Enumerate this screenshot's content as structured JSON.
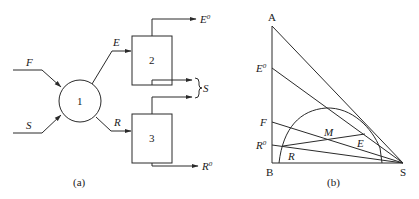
{
  "figure_a": {
    "caption": "(a)",
    "nodes": {
      "mixer": {
        "label": "1",
        "shape": "circle"
      },
      "unit_2": {
        "label": "2",
        "shape": "rectangle"
      },
      "unit_3": {
        "label": "3",
        "shape": "rectangle"
      }
    },
    "streams": {
      "feed": "F",
      "solvent_in": "S",
      "extract": "E",
      "raffinate": "R",
      "extract_product": "E",
      "extract_product_sup": "0",
      "raffinate_product": "R",
      "raffinate_product_sup": "0",
      "solvent_recovered": "S"
    }
  },
  "figure_b": {
    "caption": "(b)",
    "vertices": {
      "top": "A",
      "bottom_left": "B",
      "bottom_right": "S"
    },
    "axis_points": {
      "e0": "E",
      "e0_sup": "0",
      "f": "F",
      "r0": "R",
      "r0_sup": "0"
    },
    "interior_points": {
      "mixture": "M",
      "extract": "E",
      "raffinate": "R"
    }
  },
  "colors": {
    "line": "#2a2a2a",
    "text": "#1a1a1a",
    "background": "#ffffff"
  }
}
